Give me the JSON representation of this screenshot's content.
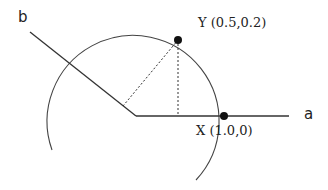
{
  "diagram": {
    "axes": [
      {
        "id": "a",
        "label": "a"
      },
      {
        "id": "b",
        "label": "b"
      }
    ],
    "points": [
      {
        "id": "Y",
        "label": "Y (0.5,0.2)"
      },
      {
        "id": "X",
        "label": "X (1.0,0)"
      }
    ],
    "colors": {
      "stroke": "#333333",
      "point": "#111111"
    }
  }
}
